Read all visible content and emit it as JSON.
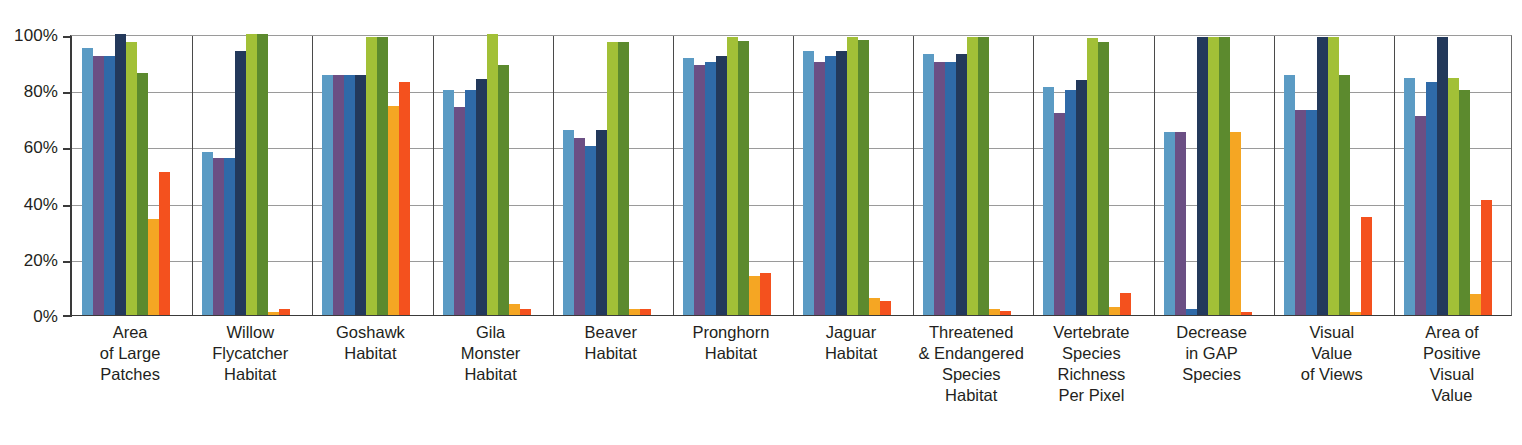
{
  "chart_data": {
    "type": "bar",
    "title": "",
    "subtitle": "",
    "xlabel": "",
    "ylabel": "",
    "ylim": [
      0,
      100
    ],
    "y_tick_labels": [
      "100%",
      "80%",
      "60%",
      "40%",
      "20%",
      "0%"
    ],
    "y_tick_values": [
      100,
      80,
      60,
      40,
      20,
      0
    ],
    "grid": true,
    "legend_position": "none",
    "units": "percent",
    "categories": [
      "Area of Large Patches",
      "Willow Flycatcher Habitat",
      "Goshawk Habitat",
      "Gila Monster Habitat",
      "Beaver Habitat",
      "Pronghorn Habitat",
      "Jaguar Habitat",
      "Threatened & Endangered Species Habitat",
      "Vertebrate Species Richness Per Pixel",
      "Decrease in GAP Species",
      "Visual Value of Views",
      "Area of Positive Visual Value"
    ],
    "category_lines": [
      [
        "Area",
        "of Large",
        "Patches"
      ],
      [
        "Willow",
        "Flycatcher",
        "Habitat"
      ],
      [
        "Goshawk",
        "Habitat"
      ],
      [
        "Gila",
        "Monster",
        "Habitat"
      ],
      [
        "Beaver",
        "Habitat"
      ],
      [
        "Pronghorn",
        "Habitat"
      ],
      [
        "Jaguar",
        "Habitat"
      ],
      [
        "Threatened",
        "& Endangered",
        "Species",
        "Habitat"
      ],
      [
        "Vertebrate",
        "Species",
        "Richness",
        "Per Pixel"
      ],
      [
        "Decrease",
        "in GAP",
        "Species"
      ],
      [
        "Visual",
        "Value",
        "of Views"
      ],
      [
        "Area of",
        "Positive",
        "Visual",
        "Value"
      ]
    ],
    "series": [
      {
        "name": "Series 1",
        "color": "#5b9bc4",
        "values": [
          95,
          58,
          85.5,
          80,
          66,
          91.5,
          94,
          93,
          81,
          65,
          85.5,
          84.5
        ]
      },
      {
        "name": "Series 2",
        "color": "#6b4f84",
        "values": [
          92,
          56,
          85.5,
          74,
          63,
          89,
          90,
          90,
          72,
          65,
          73,
          71
        ]
      },
      {
        "name": "Series 3",
        "color": "#2f6aa8",
        "values": [
          92,
          56,
          85.5,
          80,
          60,
          90,
          92,
          90,
          80,
          2,
          73,
          83
        ]
      },
      {
        "name": "Series 4",
        "color": "#23395b",
        "values": [
          100,
          94,
          85.5,
          84,
          66,
          92,
          94,
          93,
          83.5,
          99,
          99,
          99
        ]
      },
      {
        "name": "Series 5",
        "color": "#a2c037",
        "values": [
          97,
          100,
          99,
          100,
          97,
          99,
          99,
          99,
          98.5,
          99,
          99,
          84.5
        ]
      },
      {
        "name": "Series 6",
        "color": "#5c8a2e",
        "values": [
          86,
          100,
          99,
          89,
          97,
          97.5,
          98,
          99,
          97,
          99,
          85.5,
          80
        ]
      },
      {
        "name": "Series 7",
        "color": "#f5a623",
        "values": [
          34,
          1,
          74.5,
          4,
          2,
          14,
          6,
          2,
          3,
          65,
          1,
          7.5
        ]
      },
      {
        "name": "Series 8",
        "color": "#f4511e",
        "values": [
          51,
          2,
          83,
          2,
          2,
          15,
          5,
          1.5,
          8,
          1,
          35,
          41
        ]
      }
    ]
  },
  "axis": {
    "y_label_100": "100%",
    "y_label_80": "80%",
    "y_label_60": "60%",
    "y_label_40": "40%",
    "y_label_20": "20%",
    "y_label_0": "0%"
  }
}
